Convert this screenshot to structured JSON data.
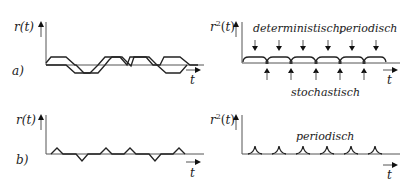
{
  "panel_a": {
    "row_label": "a)",
    "left": {
      "y_label": "r(t)",
      "x_label": "t",
      "signal": "trapezoid pulses, alternating +/- (sequence + - + + - +)",
      "pulse_signs": [
        1,
        -1,
        1,
        1,
        -1,
        1
      ]
    },
    "right": {
      "y_label": "r²(t)",
      "x_label": "t",
      "annotation_top": "deterministisch,",
      "annotation_top2": "periodisch",
      "annotation_bottom": "stochastisch",
      "down_arrow_count": 6,
      "up_arrow_count": 5
    }
  },
  "panel_b": {
    "row_label": "b)",
    "left": {
      "y_label": "r(t)",
      "x_label": "t",
      "signal": "triangle pulses, alternating +/-",
      "pulse_signs": [
        1,
        -1,
        1,
        1,
        -1,
        1
      ]
    },
    "right": {
      "y_label": "r²(t)",
      "x_label": "t",
      "annotation": "periodisch",
      "cusp_count": 6
    }
  }
}
